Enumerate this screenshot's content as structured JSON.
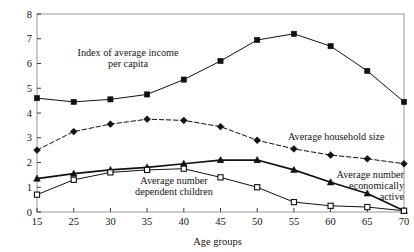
{
  "chart_data": {
    "type": "line",
    "title": "",
    "xlabel": "Age groups",
    "ylabel": "",
    "categories": [
      "15",
      "25",
      "30",
      "35",
      "40",
      "45",
      "50",
      "55",
      "60",
      "65",
      "70"
    ],
    "xlim": [
      0,
      10
    ],
    "ylim": [
      0,
      8
    ],
    "yticks": [
      "0",
      "1",
      "2",
      "3",
      "4",
      "5",
      "6",
      "7",
      "8"
    ],
    "grid": false,
    "legend": "inline-annotations",
    "series": [
      {
        "name": "Index of average income per capita",
        "marker": "filled-square",
        "line": "solid",
        "values": [
          4.6,
          4.45,
          4.55,
          4.75,
          5.35,
          6.1,
          6.95,
          7.2,
          6.7,
          5.7,
          4.45
        ]
      },
      {
        "name": "Average household size",
        "marker": "filled-diamond",
        "line": "dashed",
        "values": [
          2.5,
          3.25,
          3.55,
          3.75,
          3.7,
          3.45,
          2.9,
          2.55,
          2.3,
          2.15,
          1.95
        ]
      },
      {
        "name": "Average number economically active",
        "marker": "filled-triangle",
        "line": "solid",
        "values": [
          1.35,
          1.55,
          1.7,
          1.8,
          1.95,
          2.1,
          2.1,
          1.7,
          1.2,
          0.75,
          0.05
        ]
      },
      {
        "name": "Average number dependent children",
        "marker": "open-square",
        "line": "solid",
        "values": [
          0.7,
          1.3,
          1.6,
          1.7,
          1.75,
          1.4,
          1.0,
          0.4,
          0.25,
          0.2,
          0.05
        ]
      }
    ],
    "annotations": [
      {
        "id": "income-label",
        "lines": [
          "Index of average income",
          "per capita"
        ],
        "align": "center"
      },
      {
        "id": "household-label",
        "lines": [
          "Average household size"
        ],
        "align": "left"
      },
      {
        "id": "economically-active-label",
        "lines": [
          "Average number",
          "economically",
          "active"
        ],
        "align": "right"
      },
      {
        "id": "dependent-children-label",
        "lines": [
          "Average number",
          "dependent children"
        ],
        "align": "center"
      }
    ]
  }
}
